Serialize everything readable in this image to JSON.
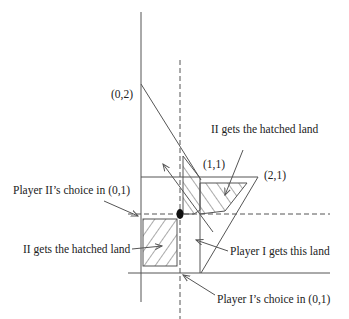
{
  "diagram": {
    "labels": {
      "point_02": "(0,2)",
      "point_11": "(1,1)",
      "point_21": "(2,1)",
      "ii_hatched_top": "II gets the hatched land",
      "ii_hatched_bottom": "II gets the hatched land",
      "player_ii_choice": "Player II’s choice in (0,1)",
      "player_i_land": "Player I gets this land",
      "player_i_choice": "Player I’s choice in (0,1)"
    },
    "colors": {
      "line": "#555555",
      "text": "#222222",
      "background": "#ffffff"
    }
  }
}
